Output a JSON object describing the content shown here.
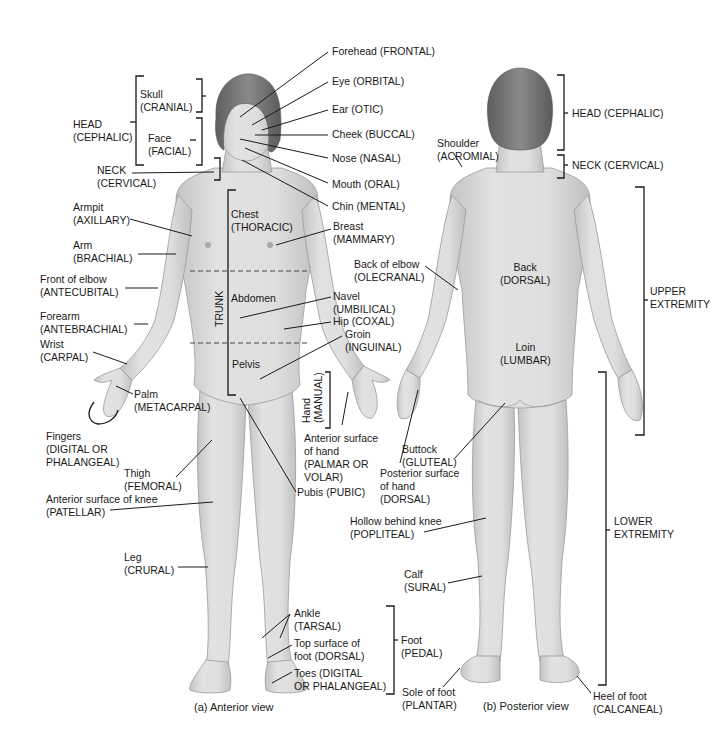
{
  "figure": {
    "colors": {
      "skin": "#dcdcdc",
      "skin_shade": "#bdbdbd",
      "hair": "#7a7a7a",
      "line": "#1a1a1a",
      "background": "#ffffff"
    },
    "anterior": {
      "caption": "(a) Anterior view",
      "labels": {
        "head": "HEAD\n(CEPHALIC)",
        "skull": "Skull\n(CRANIAL)",
        "face": "Face\n(FACIAL)",
        "neck": "NECK\n(CERVICAL)",
        "forehead": "Forehead (FRONTAL)",
        "eye": "Eye (ORBITAL)",
        "ear": "Ear (OTIC)",
        "cheek": "Cheek (BUCCAL)",
        "nose": "Nose (NASAL)",
        "mouth": "Mouth (ORAL)",
        "chin": "Chin (MENTAL)",
        "armpit": "Armpit\n(AXILLARY)",
        "arm": "Arm\n(BRACHIAL)",
        "front_elbow": "Front of elbow\n(ANTECUBITAL)",
        "forearm": "Forearm\n(ANTEBRACHIAL)",
        "wrist": "Wrist\n(CARPAL)",
        "palm": "Palm\n(METACARPAL)",
        "fingers": "Fingers\n(DIGITAL OR\nPHALANGEAL)",
        "thigh": "Thigh\n(FEMORAL)",
        "knee": "Anterior surface of knee\n(PATELLAR)",
        "leg": "Leg\n(CRURAL)",
        "chest": "Chest\n(THORACIC)",
        "abdomen": "Abdomen",
        "pelvis": "Pelvis",
        "trunk": "TRUNK",
        "breast": "Breast\n(MAMMARY)",
        "navel": "Navel\n(UMBILICAL)",
        "hip": "Hip (COXAL)",
        "groin": "Groin\n(INGUINAL)",
        "hand": "Hand\n(MANUAL)",
        "anterior_hand": "Anterior surface\nof hand\n(PALMAR OR\nVOLAR)",
        "pubis": "Pubis (PUBIC)",
        "ankle": "Ankle\n(TARSAL)",
        "top_foot": "Top surface of\nfoot (DORSAL)",
        "toes": "Toes (DIGITAL\nOR PHALANGEAL)",
        "foot": "Foot\n(PEDAL)"
      }
    },
    "posterior": {
      "caption": "(b) Posterior view",
      "labels": {
        "head": "HEAD (CEPHALIC)",
        "neck": "NECK (CERVICAL)",
        "shoulder": "Shoulder\n(ACROMIAL)",
        "back_elbow": "Back of elbow\n(OLECRANAL)",
        "back": "Back\n(DORSAL)",
        "loin": "Loin\n(LUMBAR)",
        "upper_extremity": "UPPER\nEXTREMITY",
        "lower_extremity": "LOWER\nEXTREMITY",
        "buttock": "Buttock\n(GLUTEAL)",
        "posterior_hand": "Posterior surface\nof hand\n(DORSAL)",
        "popliteal": "Hollow behind knee\n(POPLITEAL)",
        "calf": "Calf\n(SURAL)",
        "sole": "Sole of foot\n(PLANTAR)",
        "heel": "Heel of foot\n(CALCANEAL)"
      }
    }
  }
}
